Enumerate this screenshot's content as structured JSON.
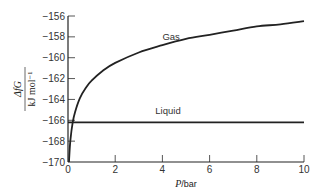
{
  "chart_data": {
    "type": "line",
    "title": "",
    "xlabel": "P/bar",
    "ylabel": "ΔfG / kJ mol⁻¹",
    "xlim": [
      0,
      10
    ],
    "ylim": [
      -170,
      -156
    ],
    "x_ticks": [
      0,
      2,
      4,
      6,
      8,
      10
    ],
    "y_ticks": [
      -170,
      -168,
      -166,
      -164,
      -162,
      -160,
      -158,
      -156
    ],
    "grid": false,
    "legend": "inline labels",
    "series": [
      {
        "name": "Gas",
        "x": [
          0.03,
          0.05,
          0.1,
          0.2,
          0.3,
          0.5,
          0.75,
          1,
          1.5,
          2,
          3,
          4,
          5,
          6,
          7,
          8,
          9,
          10
        ],
        "values": [
          -170.9,
          -169.6,
          -167.9,
          -166.2,
          -165.2,
          -163.9,
          -162.9,
          -162.2,
          -161.2,
          -160.5,
          -159.5,
          -158.8,
          -158.2,
          -157.8,
          -157.4,
          -157.0,
          -156.8,
          -156.5
        ]
      },
      {
        "name": "Liquid",
        "x": [
          0,
          10
        ],
        "values": [
          -166.2,
          -166.2
        ]
      }
    ],
    "annotations": [
      {
        "text": "Gas",
        "x": 4.0,
        "y": -158.3
      },
      {
        "text": "Liquid",
        "x": 3.7,
        "y": -165.4
      }
    ]
  },
  "labels": {
    "xlabel_italic": "P",
    "xlabel_rest": "/bar",
    "ylabel_top": "ΔfG",
    "ylabel_bottom": "kJ  mol⁻¹",
    "gas": "Gas",
    "liquid": "Liquid"
  }
}
